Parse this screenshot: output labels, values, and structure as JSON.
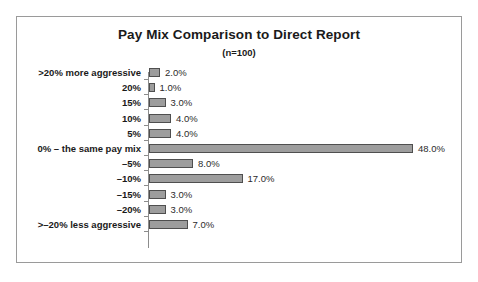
{
  "chart_data": {
    "type": "bar",
    "orientation": "horizontal",
    "title": "Pay Mix Comparison to Direct Report",
    "subtitle": "(n=100)",
    "xlabel": "",
    "ylabel": "",
    "xlim": [
      0,
      48
    ],
    "grid": false,
    "legend": "none",
    "axis_line": true,
    "tick_marks": true,
    "categories": [
      ">20% more aggressive",
      "20%",
      "15%",
      "10%",
      "5%",
      "0% – the same pay mix",
      "–5%",
      "–10%",
      "–15%",
      "–20%",
      ">–20% less aggressive"
    ],
    "values": [
      2.0,
      1.0,
      3.0,
      4.0,
      4.0,
      48.0,
      8.0,
      17.0,
      3.0,
      3.0,
      7.0
    ],
    "data_labels": [
      "2.0%",
      "1.0%",
      "3.0%",
      "4.0%",
      "4.0%",
      "48.0%",
      "8.0%",
      "17.0%",
      "3.0%",
      "3.0%",
      "7.0%"
    ],
    "colors": {
      "bar_fill": "#9d9d9d",
      "bar_border": "#4f4f4f",
      "axis": "#8c8c8c",
      "frame_border": "#9a9a9a",
      "text": "#1a1a1a",
      "background": "#ffffff"
    }
  }
}
